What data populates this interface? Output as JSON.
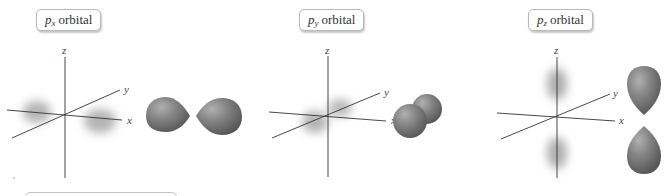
{
  "panels": [
    {
      "id": "px",
      "label_prefix": "p",
      "label_sub": "x",
      "label_suffix": "orbital",
      "axes": {
        "x": "x",
        "y": "y",
        "z": "z"
      }
    },
    {
      "id": "py",
      "label_prefix": "p",
      "label_sub": "y",
      "label_suffix": "orbital",
      "axes": {
        "x": "x",
        "y": "y",
        "z": "z"
      }
    },
    {
      "id": "pz",
      "label_prefix": "p",
      "label_sub": "z",
      "label_suffix": "orbital",
      "axes": {
        "x": "x",
        "y": "y",
        "z": "z"
      }
    }
  ],
  "colors": {
    "lobe": "#7f7f7f",
    "lobe_highlight": "#a9a9a9",
    "lobe_shadow": "#565656",
    "axis": "#333333",
    "cloud": "#9a9a9a",
    "label_border": "#b8b8b8"
  }
}
